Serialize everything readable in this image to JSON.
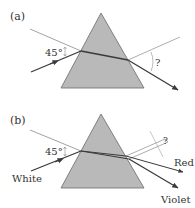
{
  "colors": {
    "prism_fill": "#b9b9b9",
    "prism_stroke": "#6a6a6a",
    "ray": "#3a3a3a",
    "normal": "#8a8a8a",
    "text": "#333333"
  },
  "panel_a": {
    "label": "(a)",
    "incident_angle": "45°",
    "exit_angle": "?"
  },
  "panel_b": {
    "label": "(b)",
    "incident_angle": "45°",
    "exit_angle": "?",
    "input_light": "White",
    "output_red": "Red",
    "output_violet": "Violet"
  }
}
